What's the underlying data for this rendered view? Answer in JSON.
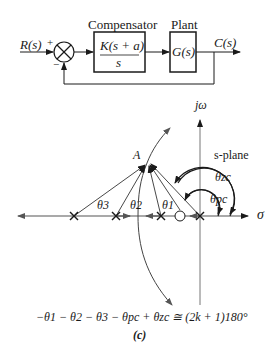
{
  "block_diagram": {
    "input_label": "R(s)",
    "plus_sign": "+",
    "minus_sign": "−",
    "compensator_title": "Compensator",
    "compensator_num": "K(s + a)",
    "compensator_den": "s",
    "plant_title": "Plant",
    "plant_tf": "G(s)",
    "output_label": "C(s)"
  },
  "s_plane": {
    "imag_axis_label": "jω",
    "real_axis_label": "σ",
    "plane_label": "s-plane",
    "point_label": "A",
    "angle_labels": {
      "theta1": "θ1",
      "theta2": "θ2",
      "theta3": "θ3",
      "theta_pc": "θpc",
      "theta_zc": "θzc"
    },
    "poles_count": 4,
    "zeros_count": 1
  },
  "equation": "−θ1 − θ2 − θ3 − θpc + θzc ≅ (2k + 1)180°",
  "caption": "(c)"
}
